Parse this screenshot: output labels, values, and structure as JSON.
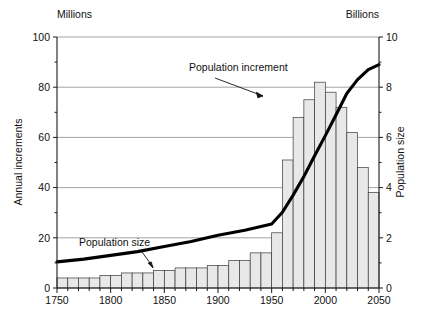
{
  "chart_data": {
    "type": "bar",
    "title": "",
    "subtitle": "",
    "xlabel": "",
    "ylabel": "Annual increments",
    "y2label": "Population size",
    "left_unit_label": "Millions",
    "right_unit_label": "Billions",
    "xlim": [
      1750,
      2050
    ],
    "ylim": [
      0,
      100
    ],
    "y2lim": [
      0,
      10
    ],
    "xticks": [
      1750,
      1800,
      1850,
      1900,
      1950,
      2000,
      2050
    ],
    "xtick_labels": [
      "1750",
      "1800",
      "1850",
      "1900",
      "1950",
      "2000",
      "2050"
    ],
    "xtick_minor_step": 10,
    "yticks": [
      0,
      20,
      40,
      60,
      80,
      100
    ],
    "ytick_labels": [
      "0",
      "20",
      "40",
      "60",
      "80",
      "100"
    ],
    "ytick_minor": [
      10,
      30,
      50,
      70,
      90
    ],
    "y2ticks": [
      0,
      2,
      4,
      6,
      8,
      10
    ],
    "y2tick_labels": [
      "0",
      "2",
      "4",
      "6",
      "8",
      "10"
    ],
    "y2tick_minor": [
      1,
      3,
      5,
      7,
      9
    ],
    "grid": true,
    "grid_values": [
      20,
      40,
      60,
      80,
      100
    ],
    "legend_position": "inline-annotations",
    "bar_color": "#e8e8e8",
    "bar_edge_color": "#3a3a3a",
    "line_color": "#000000",
    "categories": [
      1750,
      1760,
      1770,
      1780,
      1790,
      1800,
      1810,
      1820,
      1830,
      1840,
      1850,
      1860,
      1870,
      1880,
      1890,
      1900,
      1910,
      1920,
      1930,
      1940,
      1950,
      1960,
      1970,
      1980,
      1990,
      2000,
      2010,
      2020,
      2030,
      2040
    ],
    "series": [
      {
        "name": "Population increment",
        "unit": "Millions",
        "axis": "left",
        "type": "bar",
        "values": [
          4,
          4,
          4,
          4,
          5,
          5,
          6,
          6,
          6,
          7,
          7,
          8,
          8,
          8,
          9,
          9,
          11,
          11,
          14,
          14,
          22,
          51,
          68,
          75,
          82,
          78,
          72,
          62,
          48,
          38
        ]
      },
      {
        "name": "Population size",
        "unit": "Billions",
        "axis": "right",
        "type": "line",
        "x": [
          1750,
          1775,
          1800,
          1825,
          1850,
          1875,
          1900,
          1925,
          1950,
          1960,
          1970,
          1980,
          1990,
          2000,
          2010,
          2020,
          2030,
          2040,
          2050
        ],
        "values": [
          1.04,
          1.15,
          1.3,
          1.45,
          1.65,
          1.85,
          2.1,
          2.3,
          2.55,
          3.02,
          3.7,
          4.44,
          5.27,
          6.07,
          6.9,
          7.75,
          8.3,
          8.7,
          8.9
        ]
      }
    ],
    "annotations": [
      {
        "name": "population-increment",
        "text": "Population increment",
        "points_to_year": 1975,
        "points_to_value_millions": 81
      },
      {
        "name": "population-size",
        "text": "Population size",
        "points_to_year": 1828,
        "points_to_value_billions": 1.46
      }
    ]
  },
  "axes": {
    "left_unit": "Millions",
    "right_unit": "Billions",
    "left_title": "Annual increments",
    "right_title": "Population size"
  },
  "annotations": {
    "increment_label": "Population increment",
    "size_label": "Population size"
  },
  "colors": {
    "bar_fill": "#e8e8e8",
    "bar_stroke": "#3a3a3a",
    "curve": "#000000",
    "grid": "#8d8d8d",
    "axis": "#1a1a1a"
  }
}
